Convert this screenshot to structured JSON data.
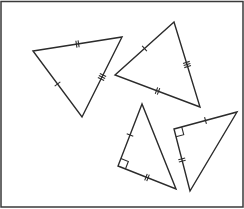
{
  "diagram": {
    "stroke_color": "#2b2b2b",
    "border_color": "#3a3a3a",
    "triangles": [
      {
        "id": "triangle-1",
        "vertices": [
          [
            33,
            51
          ],
          [
            122,
            37
          ],
          [
            82,
            117
          ]
        ],
        "marks": [
          {
            "side": [
              0,
              1
            ],
            "ticks": 2
          },
          {
            "side": [
              1,
              2
            ],
            "ticks": 3
          },
          {
            "side": [
              2,
              0
            ],
            "ticks": 1
          }
        ],
        "right_angle": null
      },
      {
        "id": "triangle-2",
        "vertices": [
          [
            174,
            22
          ],
          [
            115,
            75
          ],
          [
            200,
            107
          ]
        ],
        "marks": [
          {
            "side": [
              0,
              1
            ],
            "ticks": 1
          },
          {
            "side": [
              1,
              2
            ],
            "ticks": 2
          },
          {
            "side": [
              2,
              0
            ],
            "ticks": 3
          }
        ],
        "right_angle": null
      },
      {
        "id": "triangle-3",
        "vertices": [
          [
            142,
            104
          ],
          [
            118,
            166
          ],
          [
            176,
            189
          ]
        ],
        "marks": [
          {
            "side": [
              0,
              1
            ],
            "ticks": 1
          },
          {
            "side": [
              1,
              2
            ],
            "ticks": 2
          }
        ],
        "right_angle": 1
      },
      {
        "id": "triangle-4",
        "vertices": [
          [
            174,
            129
          ],
          [
            237,
            112
          ],
          [
            190,
            191
          ]
        ],
        "marks": [
          {
            "side": [
              0,
              1
            ],
            "ticks": 1
          },
          {
            "side": [
              0,
              2
            ],
            "ticks": 2
          }
        ],
        "right_angle": 0
      }
    ]
  }
}
